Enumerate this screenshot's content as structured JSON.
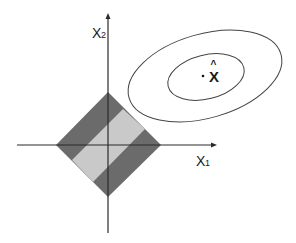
{
  "diagram": {
    "type": "lasso-constraint-illustration",
    "axes": {
      "x_label": "X",
      "x_sub": "1",
      "y_label": "X",
      "y_sub": "2"
    },
    "estimate": {
      "label": "X",
      "hat": "^"
    },
    "colors": {
      "axis": "#2a2a2a",
      "diamond_dark": "#6b6b6b",
      "diamond_light": "#c9c9c9",
      "ellipse": "#444444"
    }
  }
}
